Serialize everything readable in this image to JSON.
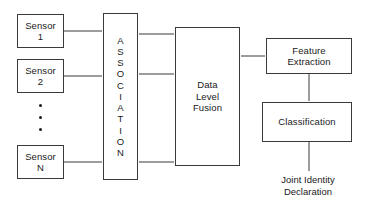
{
  "diagram": {
    "background_color": "#ffffff",
    "line_color": "#3a3a3a",
    "text_color": "#1a1a1a",
    "sensors": [
      {
        "line1": "Sensor",
        "line2": "1"
      },
      {
        "line1": "Sensor",
        "line2": "2"
      },
      {
        "line1": "Sensor",
        "line2": "N"
      }
    ],
    "ellipsis": "•••",
    "association": {
      "label": "ASSOCIATION",
      "orientation": "vertical-stacked-letters",
      "letters": [
        "A",
        "S",
        "S",
        "O",
        "C",
        "I",
        "A",
        "T",
        "I",
        "O",
        "N"
      ]
    },
    "fusion": {
      "line1": "Data",
      "line2": "Level",
      "line3": "Fusion"
    },
    "feature_extraction": {
      "line1": "Feature",
      "line2": "Extraction"
    },
    "classification": {
      "line1": "Classification"
    },
    "output": {
      "line1": "Joint Identity",
      "line2": "Declaration"
    }
  }
}
